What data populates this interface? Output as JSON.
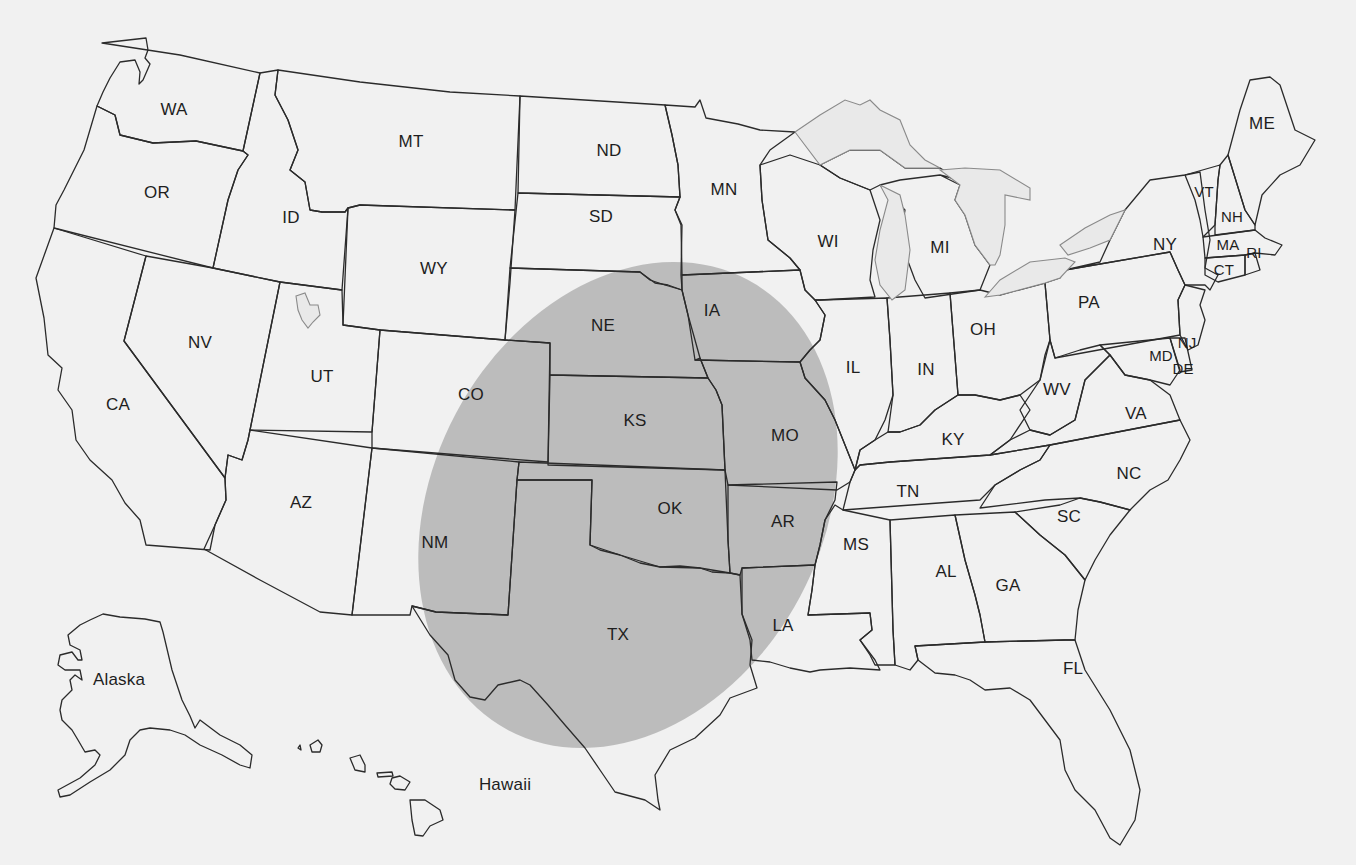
{
  "map": {
    "title": "",
    "background_color": "#f1f1f1",
    "state_fill": "#f4f4f4",
    "border_color": "#2b2b2b",
    "highlight_color": "#b7b7b7",
    "highlight_region": {
      "shape": "ellipse",
      "description": "Shaded elliptical region over the central/southern Great Plains",
      "states_fully_covered": [
        "NE",
        "KS",
        "OK",
        "IA",
        "MO",
        "AR"
      ],
      "states_partially_covered": [
        "TX",
        "LA",
        "CO",
        "NM",
        "SD"
      ]
    },
    "labels": {
      "WA": "WA",
      "OR": "OR",
      "CA": "CA",
      "ID": "ID",
      "NV": "NV",
      "MT": "MT",
      "WY": "WY",
      "UT": "UT",
      "AZ": "AZ",
      "CO": "CO",
      "NM": "NM",
      "ND": "ND",
      "SD": "SD",
      "NE": "NE",
      "KS": "KS",
      "OK": "OK",
      "TX": "TX",
      "MN": "MN",
      "IA": "IA",
      "MO": "MO",
      "AR": "AR",
      "LA": "LA",
      "WI": "WI",
      "IL": "IL",
      "MI": "MI",
      "IN": "IN",
      "OH": "OH",
      "KY": "KY",
      "TN": "TN",
      "MS": "MS",
      "AL": "AL",
      "GA": "GA",
      "FL": "FL",
      "SC": "SC",
      "NC": "NC",
      "VA": "VA",
      "WV": "WV",
      "PA": "PA",
      "NY": "NY",
      "MD": "MD",
      "DE": "DE",
      "NJ": "NJ",
      "CT": "CT",
      "RI": "RI",
      "MA": "MA",
      "VT": "VT",
      "NH": "NH",
      "ME": "ME",
      "AK": "Alaska",
      "HI": "Hawaii"
    }
  }
}
